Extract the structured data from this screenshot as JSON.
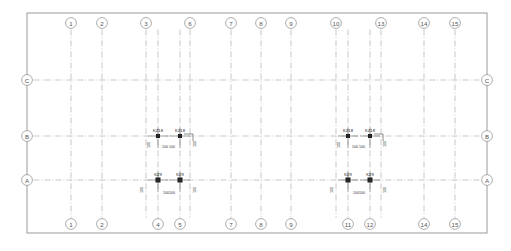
{
  "drawing": {
    "title": "Structural Column Layout Plan",
    "background_color": "#ffffff",
    "frame": {
      "x": 27,
      "y": 13,
      "width": 460,
      "height": 220,
      "stroke": "#9a9a9a"
    },
    "gridline_color": "#b0b0b0",
    "column_fill": "#1a1a1a",
    "bubble_stroke": "#8a8a8a",
    "bubble_radius": 5.4
  },
  "axes": {
    "vertical_label_row_top_y": 23,
    "vertical_label_row_bottom_y": 224,
    "horizontal_label_left_x": 27,
    "horizontal_label_right_x": 487,
    "top_numbers": [
      {
        "label": "1",
        "x": 71
      },
      {
        "label": "2",
        "x": 102
      },
      {
        "label": "3",
        "x": 146
      },
      {
        "label": "6",
        "x": 190
      },
      {
        "label": "7",
        "x": 231
      },
      {
        "label": "8",
        "x": 261
      },
      {
        "label": "9",
        "x": 291
      },
      {
        "label": "10",
        "x": 336
      },
      {
        "label": "13",
        "x": 381
      },
      {
        "label": "14",
        "x": 424
      },
      {
        "label": "15",
        "x": 455
      }
    ],
    "bottom_numbers": [
      {
        "label": "1",
        "x": 71
      },
      {
        "label": "2",
        "x": 102
      },
      {
        "label": "4",
        "x": 158
      },
      {
        "label": "5",
        "x": 180
      },
      {
        "label": "7",
        "x": 231
      },
      {
        "label": "8",
        "x": 261
      },
      {
        "label": "9",
        "x": 291
      },
      {
        "label": "11",
        "x": 348
      },
      {
        "label": "12",
        "x": 370
      },
      {
        "label": "14",
        "x": 424
      },
      {
        "label": "15",
        "x": 455
      }
    ],
    "letters": [
      {
        "label": "C",
        "y": 80
      },
      {
        "label": "B",
        "y": 136
      },
      {
        "label": "A",
        "y": 180
      }
    ]
  },
  "grid": {
    "vertical_lines_x": [
      71,
      102,
      146,
      158,
      180,
      190,
      231,
      261,
      291,
      336,
      348,
      370,
      381,
      424,
      455
    ],
    "horizontal_lines_y": [
      80,
      136,
      180
    ]
  },
  "column_clusters": [
    {
      "name": "cluster-left-row-b",
      "columns": [
        {
          "tag": "KZ18",
          "x": 158,
          "y": 136,
          "w": 4.0,
          "h": 4.0,
          "label_dx": 0,
          "label_dy": -4,
          "dims": [
            {
              "value": "100",
              "x": 150,
              "y": 145,
              "rotate": -90
            },
            {
              "value": "100",
              "x": 165,
              "y": 148,
              "rotate": 0
            }
          ]
        },
        {
          "tag": "KZ18",
          "x": 180,
          "y": 136,
          "w": 4.0,
          "h": 4.0,
          "label_dx": 0,
          "label_dy": -4,
          "dims": [
            {
              "value": "100",
              "x": 172,
              "y": 148,
              "rotate": 0
            },
            {
              "value": "100",
              "x": 196,
              "y": 144,
              "rotate": -90
            }
          ]
        }
      ]
    },
    {
      "name": "cluster-left-row-a",
      "columns": [
        {
          "tag": "KZ9",
          "x": 158,
          "y": 180,
          "w": 5.0,
          "h": 5.0,
          "label_dx": 0,
          "label_dy": -4,
          "dims": [
            {
              "value": "100",
              "x": 143,
              "y": 190,
              "rotate": -90
            },
            {
              "value": "100",
              "x": 166,
              "y": 194,
              "rotate": 0
            }
          ]
        },
        {
          "tag": "KZ9",
          "x": 180,
          "y": 180,
          "w": 5.0,
          "h": 5.0,
          "label_dx": 0,
          "label_dy": -4,
          "dims": [
            {
              "value": "100",
              "x": 172,
              "y": 194,
              "rotate": 0
            },
            {
              "value": "100",
              "x": 196,
              "y": 190,
              "rotate": -90
            }
          ]
        }
      ]
    },
    {
      "name": "cluster-right-row-b",
      "columns": [
        {
          "tag": "KZ18",
          "x": 348,
          "y": 136,
          "w": 4.0,
          "h": 4.0,
          "label_dx": 0,
          "label_dy": -4,
          "dims": [
            {
              "value": "100",
              "x": 340,
              "y": 145,
              "rotate": -90
            },
            {
              "value": "100",
              "x": 355,
              "y": 148,
              "rotate": 0
            }
          ]
        },
        {
          "tag": "KZ18",
          "x": 370,
          "y": 136,
          "w": 4.0,
          "h": 4.0,
          "label_dx": 0,
          "label_dy": -4,
          "dims": [
            {
              "value": "100",
              "x": 362,
              "y": 148,
              "rotate": 0
            },
            {
              "value": "100",
              "x": 386,
              "y": 144,
              "rotate": -90
            }
          ]
        }
      ]
    },
    {
      "name": "cluster-right-row-a",
      "columns": [
        {
          "tag": "KZ9",
          "x": 348,
          "y": 180,
          "w": 5.0,
          "h": 5.0,
          "label_dx": 0,
          "label_dy": -4,
          "dims": [
            {
              "value": "100",
              "x": 333,
              "y": 190,
              "rotate": -90
            },
            {
              "value": "100",
              "x": 356,
              "y": 194,
              "rotate": 0
            }
          ]
        },
        {
          "tag": "KZ9",
          "x": 370,
          "y": 180,
          "w": 5.0,
          "h": 5.0,
          "label_dx": 0,
          "label_dy": -4,
          "dims": [
            {
              "value": "100",
              "x": 362,
              "y": 194,
              "rotate": 0
            },
            {
              "value": "100",
              "x": 386,
              "y": 190,
              "rotate": -90
            }
          ]
        }
      ]
    }
  ],
  "leaders": [
    {
      "name": "leader-kz18-left-b2",
      "points": "184,134 193,134 193,141"
    },
    {
      "name": "leader-kz18-right-b2",
      "points": "374,134 383,134 383,141"
    }
  ]
}
